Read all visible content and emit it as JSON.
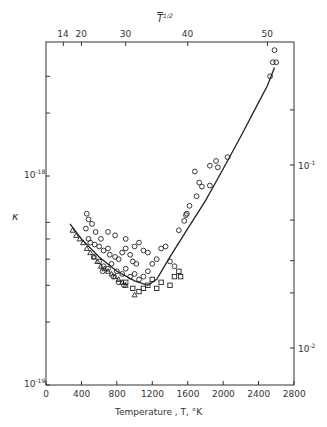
{
  "chart_data": {
    "type": "scatter",
    "title": "",
    "xlabel": "Temperature , T, °K",
    "ylabel": "κ",
    "top_axis_label": "T^1/2",
    "x_ticks": [
      0,
      400,
      800,
      1200,
      1600,
      2000,
      2400,
      2800
    ],
    "x_tick_labels": [
      "0",
      "400",
      "800",
      "1200",
      "1600",
      "2000",
      "2400",
      "2800"
    ],
    "xlim": [
      0,
      2800
    ],
    "y_scale": "log",
    "ylim": [
      1e-19,
      4.3e-18
    ],
    "y_tick_labels": [
      {
        "value": 1e-19,
        "label": "10^-19"
      },
      {
        "value": 1e-18,
        "label": "10^-18"
      }
    ],
    "top_ticks": [
      14,
      20,
      30,
      40,
      50
    ],
    "top_tick_labels": [
      "14",
      "20",
      "30",
      "40",
      "50"
    ],
    "right_axis": {
      "scale": "log",
      "tick_labels": [
        {
          "value": 0.1,
          "label": "10^-1"
        },
        {
          "value": 0.01,
          "label": "10^-2"
        }
      ]
    },
    "grid": false,
    "legend": null,
    "series": [
      {
        "name": "circles",
        "marker": "circle",
        "points": [
          [
            460,
            6.6e-19
          ],
          [
            480,
            6.2e-19
          ],
          [
            450,
            5.6e-19
          ],
          [
            520,
            5.9e-19
          ],
          [
            560,
            5.4e-19
          ],
          [
            620,
            5e-19
          ],
          [
            480,
            5e-19
          ],
          [
            500,
            4.8e-19
          ],
          [
            550,
            4.7e-19
          ],
          [
            600,
            4.6e-19
          ],
          [
            650,
            4.4e-19
          ],
          [
            700,
            4.5e-19
          ],
          [
            720,
            4.2e-19
          ],
          [
            780,
            4.1e-19
          ],
          [
            820,
            4e-19
          ],
          [
            860,
            4.3e-19
          ],
          [
            900,
            4.5e-19
          ],
          [
            950,
            4.2e-19
          ],
          [
            980,
            3.9e-19
          ],
          [
            1020,
            3.8e-19
          ],
          [
            540,
            4.1e-19
          ],
          [
            600,
            3.9e-19
          ],
          [
            650,
            3.7e-19
          ],
          [
            700,
            3.6e-19
          ],
          [
            740,
            3.8e-19
          ],
          [
            800,
            3.5e-19
          ],
          [
            860,
            3.4e-19
          ],
          [
            900,
            3.6e-19
          ],
          [
            950,
            3.3e-19
          ],
          [
            1000,
            3.4e-19
          ],
          [
            1050,
            3.2e-19
          ],
          [
            1100,
            3.3e-19
          ],
          [
            1150,
            3.5e-19
          ],
          [
            1200,
            3.8e-19
          ],
          [
            1250,
            4e-19
          ],
          [
            1300,
            4.5e-19
          ],
          [
            1350,
            4.6e-19
          ],
          [
            1400,
            3.9e-19
          ],
          [
            1450,
            3.7e-19
          ],
          [
            1100,
            4.4e-19
          ],
          [
            1150,
            4.3e-19
          ],
          [
            1050,
            4.8e-19
          ],
          [
            1000,
            4.6e-19
          ],
          [
            900,
            5e-19
          ],
          [
            780,
            5.2e-19
          ],
          [
            700,
            5.4e-19
          ],
          [
            640,
            3.5e-19
          ],
          [
            760,
            3.3e-19
          ],
          [
            820,
            3.1e-19
          ],
          [
            880,
            3e-19
          ],
          [
            1500,
            5.5e-19
          ],
          [
            1560,
            6.1e-19
          ],
          [
            1580,
            6.5e-19
          ],
          [
            1730,
            9.3e-19
          ],
          [
            1760,
            8.9e-19
          ],
          [
            1680,
            1.05e-18
          ],
          [
            1850,
            1.12e-18
          ],
          [
            1920,
            1.18e-18
          ],
          [
            1940,
            1.1e-18
          ],
          [
            2050,
            1.23e-18
          ],
          [
            1590,
            6.6e-19
          ],
          [
            1700,
            8e-19
          ],
          [
            1620,
            7.2e-19
          ],
          [
            2530,
            3e-18
          ],
          [
            2560,
            3.5e-18
          ],
          [
            2600,
            3.5e-18
          ],
          [
            2580,
            4e-18
          ],
          [
            1850,
            9e-19
          ]
        ]
      },
      {
        "name": "squares",
        "marker": "square",
        "points": [
          [
            900,
            3.1e-19
          ],
          [
            980,
            2.9e-19
          ],
          [
            1050,
            2.8e-19
          ],
          [
            1150,
            3e-19
          ],
          [
            1250,
            2.9e-19
          ],
          [
            1300,
            3.1e-19
          ],
          [
            1400,
            3e-19
          ],
          [
            1450,
            3.3e-19
          ],
          [
            1520,
            3.3e-19
          ],
          [
            1500,
            3.5e-19
          ],
          [
            1200,
            3.2e-19
          ],
          [
            1100,
            2.9e-19
          ]
        ]
      },
      {
        "name": "triangles",
        "marker": "triangle",
        "points": [
          [
            300,
            5.5e-19
          ],
          [
            340,
            5.2e-19
          ],
          [
            380,
            5e-19
          ],
          [
            420,
            4.8e-19
          ],
          [
            460,
            4.5e-19
          ],
          [
            500,
            4.3e-19
          ],
          [
            540,
            4.1e-19
          ],
          [
            580,
            3.9e-19
          ],
          [
            620,
            3.7e-19
          ],
          [
            660,
            3.6e-19
          ],
          [
            700,
            3.5e-19
          ],
          [
            740,
            3.4e-19
          ],
          [
            780,
            3.3e-19
          ],
          [
            820,
            3.2e-19
          ],
          [
            860,
            3.1e-19
          ],
          [
            900,
            3e-19
          ],
          [
            1000,
            2.7e-19
          ]
        ]
      },
      {
        "name": "fit-curve",
        "marker": "line",
        "points": [
          [
            270,
            5.9e-19
          ],
          [
            400,
            5e-19
          ],
          [
            600,
            4.1e-19
          ],
          [
            800,
            3.5e-19
          ],
          [
            1000,
            3.15e-19
          ],
          [
            1150,
            3e-19
          ],
          [
            1250,
            3.2e-19
          ],
          [
            1400,
            4.1e-19
          ],
          [
            1600,
            5.6e-19
          ],
          [
            1800,
            7.6e-19
          ],
          [
            2000,
            1.08e-18
          ],
          [
            2200,
            1.55e-18
          ],
          [
            2400,
            2.25e-18
          ],
          [
            2500,
            2.7e-18
          ],
          [
            2580,
            3.3e-18
          ]
        ]
      }
    ]
  },
  "labels": {
    "top_axis_title": "T",
    "top_axis_exp": "1/2",
    "y_label": "κ",
    "x_label": "Temperature , T, °K",
    "y_1e18_base": "10",
    "y_1e18_exp": "-18",
    "y_1e19_base": "10",
    "y_1e19_exp": "-19",
    "r_1e1_base": "10",
    "r_1e1_exp": "-1",
    "r_1e2_base": "10",
    "r_1e2_exp": "-2"
  }
}
